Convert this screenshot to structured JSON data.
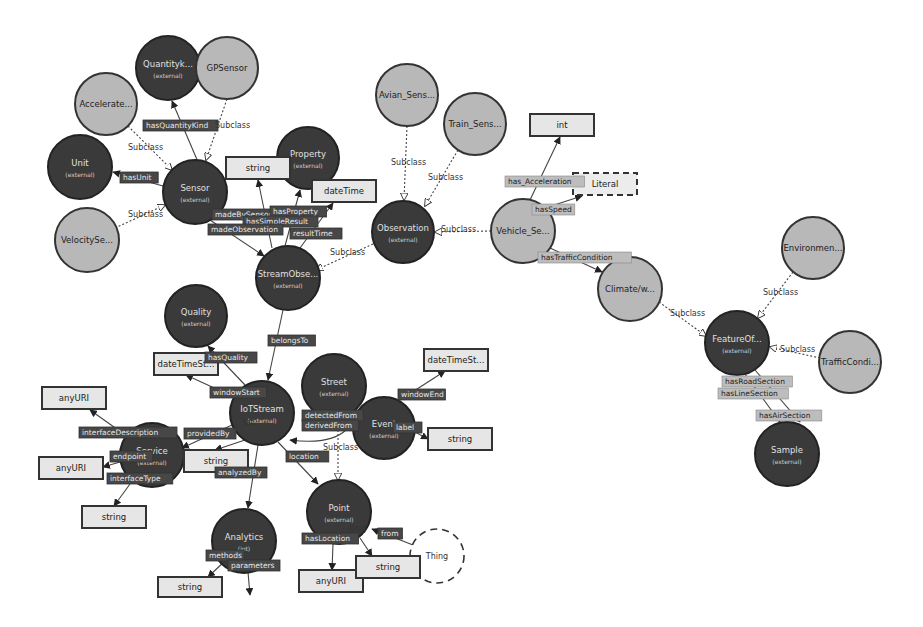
{
  "diagram": {
    "type": "ontology-graph",
    "nodes": [
      {
        "id": "quantity",
        "label": "Quantityk...",
        "sub": "(external)",
        "style": "dark",
        "x": 168,
        "y": 68,
        "r": 32
      },
      {
        "id": "gpsensor",
        "label": "GPSensor",
        "sub": "",
        "style": "light",
        "x": 227,
        "y": 68,
        "r": 31
      },
      {
        "id": "accelerate",
        "label": "Accelerate...",
        "sub": "",
        "style": "light",
        "x": 106,
        "y": 104,
        "r": 31
      },
      {
        "id": "unit",
        "label": "Unit",
        "sub": "(external)",
        "style": "dark",
        "x": 80,
        "y": 167,
        "r": 32
      },
      {
        "id": "velocityse",
        "label": "VelocitySe...",
        "sub": "",
        "style": "light",
        "x": 87,
        "y": 240,
        "r": 32
      },
      {
        "id": "sensor",
        "label": "Sensor",
        "sub": "(external)",
        "style": "dark",
        "x": 195,
        "y": 192,
        "r": 32
      },
      {
        "id": "property",
        "label": "Property",
        "sub": "(external)",
        "style": "dark",
        "x": 308,
        "y": 158,
        "r": 31
      },
      {
        "id": "avian",
        "label": "Avian_Sens...",
        "sub": "",
        "style": "light",
        "x": 407,
        "y": 95,
        "r": 31
      },
      {
        "id": "train",
        "label": "Train_Sens...",
        "sub": "",
        "style": "light",
        "x": 475,
        "y": 124,
        "r": 31
      },
      {
        "id": "observation",
        "label": "Observation",
        "sub": "(external)",
        "style": "dark",
        "x": 403,
        "y": 232,
        "r": 31
      },
      {
        "id": "streamobs",
        "label": "StreamObse...",
        "sub": "(external)",
        "style": "dark",
        "x": 288,
        "y": 278,
        "r": 32
      },
      {
        "id": "vehicle",
        "label": "Vehicle_Se...",
        "sub": "",
        "style": "light",
        "x": 523,
        "y": 231,
        "r": 32
      },
      {
        "id": "climate",
        "label": "Climate/w...",
        "sub": "",
        "style": "light",
        "x": 630,
        "y": 289,
        "r": 32
      },
      {
        "id": "environment",
        "label": "Environmen...",
        "sub": "",
        "style": "light",
        "x": 813,
        "y": 248,
        "r": 31
      },
      {
        "id": "featureof",
        "label": "FeatureOf...",
        "sub": "(external)",
        "style": "dark",
        "x": 737,
        "y": 343,
        "r": 32
      },
      {
        "id": "trafficcond",
        "label": "TrafficCondi...",
        "sub": "",
        "style": "light",
        "x": 850,
        "y": 362,
        "r": 31
      },
      {
        "id": "sample",
        "label": "Sample",
        "sub": "(external)",
        "style": "dark",
        "x": 787,
        "y": 454,
        "r": 32
      },
      {
        "id": "quality",
        "label": "Quality",
        "sub": "(external)",
        "style": "dark",
        "x": 196,
        "y": 316,
        "r": 31
      },
      {
        "id": "iotstream",
        "label": "IoTStream",
        "sub": "(external)",
        "style": "dark",
        "x": 262,
        "y": 413,
        "r": 32
      },
      {
        "id": "street",
        "label": "Street",
        "sub": "(external)",
        "style": "dark",
        "x": 334,
        "y": 386,
        "r": 32
      },
      {
        "id": "event",
        "label": "Event",
        "sub": "(external)",
        "style": "dark",
        "x": 384,
        "y": 428,
        "r": 31
      },
      {
        "id": "service",
        "label": "Service",
        "sub": "(external)",
        "style": "dark",
        "x": 152,
        "y": 455,
        "r": 32
      },
      {
        "id": "point",
        "label": "Point",
        "sub": "(external)",
        "style": "dark",
        "x": 339,
        "y": 512,
        "r": 32
      },
      {
        "id": "analytics",
        "label": "Analytics",
        "sub": "(iot)",
        "style": "dark",
        "x": 244,
        "y": 541,
        "r": 32
      },
      {
        "id": "thing",
        "label": "Thing",
        "sub": "",
        "style": "thing",
        "x": 437,
        "y": 556,
        "r": 27
      }
    ],
    "datatypes": [
      {
        "id": "dt_string1",
        "label": "string",
        "x": 226,
        "y": 157,
        "w": 64,
        "h": 22,
        "dashed": false
      },
      {
        "id": "dt_datetime1",
        "label": "dateTime",
        "x": 312,
        "y": 180,
        "w": 64,
        "h": 22,
        "dashed": false
      },
      {
        "id": "dt_int",
        "label": "int",
        "x": 530,
        "y": 114,
        "w": 64,
        "h": 22,
        "dashed": false
      },
      {
        "id": "dt_literal",
        "label": "Literal",
        "x": 573,
        "y": 173,
        "w": 64,
        "h": 22,
        "dashed": true
      },
      {
        "id": "dt_datetimest",
        "label": "dateTimeSt...",
        "x": 154,
        "y": 353,
        "w": 64,
        "h": 22,
        "dashed": false
      },
      {
        "id": "dt_datetimest2",
        "label": "dateTimeSt...",
        "x": 424,
        "y": 349,
        "w": 64,
        "h": 22,
        "dashed": false
      },
      {
        "id": "dt_anyuri1",
        "label": "anyURI",
        "x": 42,
        "y": 387,
        "w": 64,
        "h": 22,
        "dashed": false
      },
      {
        "id": "dt_string_event",
        "label": "string",
        "x": 428,
        "y": 428,
        "w": 64,
        "h": 22,
        "dashed": false
      },
      {
        "id": "dt_anyuri2",
        "label": "anyURI",
        "x": 39,
        "y": 457,
        "w": 64,
        "h": 22,
        "dashed": false
      },
      {
        "id": "dt_string_prov",
        "label": "string",
        "x": 184,
        "y": 450,
        "w": 64,
        "h": 22,
        "dashed": false
      },
      {
        "id": "dt_string_iface",
        "label": "string",
        "x": 82,
        "y": 506,
        "w": 64,
        "h": 22,
        "dashed": false
      },
      {
        "id": "dt_anyuri3",
        "label": "anyURI",
        "x": 299,
        "y": 570,
        "w": 64,
        "h": 22,
        "dashed": false
      },
      {
        "id": "dt_string_point",
        "label": "string",
        "x": 356,
        "y": 556,
        "w": 64,
        "h": 22,
        "dashed": false
      },
      {
        "id": "dt_string_analytics",
        "label": "string",
        "x": 158,
        "y": 577,
        "w": 64,
        "h": 20,
        "dashed": false
      }
    ],
    "edge_labels": [
      {
        "text": "hasQuantityKind",
        "x": 143,
        "y": 128,
        "style": "dark"
      },
      {
        "text": "Subclass",
        "x": 125,
        "y": 150,
        "style": "plain"
      },
      {
        "text": "hasUnit",
        "x": 120,
        "y": 180,
        "style": "dark"
      },
      {
        "text": "Subclass",
        "x": 125,
        "y": 217,
        "style": "plain"
      },
      {
        "text": "Subclass",
        "x": 212,
        "y": 128,
        "style": "plain"
      },
      {
        "text": "madeBySensor",
        "x": 212,
        "y": 217,
        "style": "dark"
      },
      {
        "text": "hasProperty",
        "x": 270,
        "y": 214,
        "style": "dark"
      },
      {
        "text": "hasSimpleResult",
        "x": 243,
        "y": 224,
        "style": "dark"
      },
      {
        "text": "madeObservation",
        "x": 208,
        "y": 232,
        "style": "dark"
      },
      {
        "text": "resultTime",
        "x": 290,
        "y": 236,
        "style": "dark"
      },
      {
        "text": "Subclass",
        "x": 327,
        "y": 255,
        "style": "plain"
      },
      {
        "text": "Subclass",
        "x": 388,
        "y": 165,
        "style": "plain"
      },
      {
        "text": "Subclass",
        "x": 425,
        "y": 180,
        "style": "plain"
      },
      {
        "text": "Subclass",
        "x": 438,
        "y": 232,
        "style": "plain"
      },
      {
        "text": "has_Acceleration",
        "x": 505,
        "y": 184,
        "style": "light"
      },
      {
        "text": "hasSpeed",
        "x": 532,
        "y": 212,
        "style": "light"
      },
      {
        "text": "hasTrafficCondition",
        "x": 538,
        "y": 260,
        "style": "light"
      },
      {
        "text": "Subclass",
        "x": 667,
        "y": 316,
        "style": "plain"
      },
      {
        "text": "Subclass",
        "x": 760,
        "y": 295,
        "style": "plain"
      },
      {
        "text": "Subclass",
        "x": 777,
        "y": 352,
        "style": "plain"
      },
      {
        "text": "hasRoadSection",
        "x": 722,
        "y": 384,
        "style": "light"
      },
      {
        "text": "hasLineSection",
        "x": 718,
        "y": 396,
        "style": "light"
      },
      {
        "text": "hasAirSection",
        "x": 756,
        "y": 418,
        "style": "light"
      },
      {
        "text": "belongsTo",
        "x": 268,
        "y": 343,
        "style": "dark"
      },
      {
        "text": "hasQuality",
        "x": 205,
        "y": 360,
        "style": "dark"
      },
      {
        "text": "windowStart",
        "x": 210,
        "y": 395,
        "style": "dark"
      },
      {
        "text": "windowEnd",
        "x": 398,
        "y": 397,
        "style": "dark"
      },
      {
        "text": "detectedFrom",
        "x": 302,
        "y": 418,
        "style": "dark"
      },
      {
        "text": "derivedFrom",
        "x": 302,
        "y": 428,
        "style": "dark"
      },
      {
        "text": "label",
        "x": 393,
        "y": 430,
        "style": "dark"
      },
      {
        "text": "Subclass",
        "x": 320,
        "y": 450,
        "style": "plain"
      },
      {
        "text": "providedBy",
        "x": 184,
        "y": 436,
        "style": "dark"
      },
      {
        "text": "lat",
        "x": 240,
        "y": 425,
        "style": "plain"
      },
      {
        "text": "interfaceDescription",
        "x": 79,
        "y": 435,
        "style": "dark"
      },
      {
        "text": "endpoint",
        "x": 110,
        "y": 459,
        "style": "dark"
      },
      {
        "text": "interfaceType",
        "x": 107,
        "y": 481,
        "style": "dark"
      },
      {
        "text": "analyzedBy",
        "x": 215,
        "y": 475,
        "style": "dark"
      },
      {
        "text": "location",
        "x": 286,
        "y": 459,
        "style": "dark"
      },
      {
        "text": "from",
        "x": 378,
        "y": 536,
        "style": "dark"
      },
      {
        "text": "long",
        "x": 346,
        "y": 531,
        "style": "plain"
      },
      {
        "text": "hasLocation",
        "x": 302,
        "y": 541,
        "style": "dark"
      },
      {
        "text": "methods",
        "x": 206,
        "y": 558,
        "style": "dark"
      },
      {
        "text": "parameters",
        "x": 228,
        "y": 568,
        "style": "dark"
      }
    ]
  }
}
